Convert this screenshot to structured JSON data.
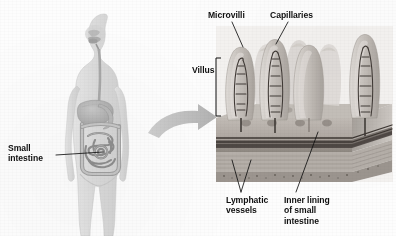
{
  "figure": {
    "background_color": "#fdfdfd",
    "ink_color": "#101010"
  },
  "labels": {
    "small_intestine": {
      "text": "Small\nintestine",
      "x": 8,
      "y": 143
    },
    "microvilli": {
      "text": "Microvilli",
      "x": 208,
      "y": 10
    },
    "capillaries": {
      "text": "Capillaries",
      "x": 270,
      "y": 10
    },
    "villus": {
      "text": "Villus",
      "x": 194,
      "y": 66
    },
    "lymphatic_vessels": {
      "text": "Lymphatic\nvessels",
      "x": 227,
      "y": 196
    },
    "inner_lining": {
      "text": "Inner lining\nof small\nintestine",
      "x": 285,
      "y": 196
    }
  },
  "leader_lines": {
    "small_intestine": "from label right edge to coiled small intestine in abdomen",
    "microvilli": "diagonal down-right to villus surface",
    "capillaries": "diagonal down-left to capillary network inside villus",
    "lymphatic_vessels": "two diagonals up-right to lacteal vessels under villi",
    "inner_lining": "diagonal up-right to mucosa surface layer"
  },
  "villus_bracket": {
    "x": 216,
    "top": 58,
    "bottom": 116
  },
  "magnify_arrow": {
    "from": "abdomen of body figure",
    "to": "villi detail panel",
    "color": "#b9b9b9"
  },
  "detail_panel": {
    "x": 216,
    "y": 28,
    "width": 176,
    "height": 152,
    "villi_count": 7,
    "tissue_layers": [
      "mucosa",
      "submucosa",
      "muscle layer",
      "serosa"
    ]
  },
  "body_figure": {
    "organs": [
      "nasal cavity",
      "oral cavity",
      "esophagus",
      "liver",
      "stomach",
      "large intestine",
      "small intestine"
    ],
    "tint": "#d8d8d8"
  },
  "colors": {
    "body_fill": "#dcdcdc",
    "organ_fill": "#c4c4c4",
    "organ_dark": "#8d8d8d",
    "tissue_mid": "#b2aca6",
    "tissue_dark": "#4a4440",
    "villus_fill": "#cdc8c3",
    "capillary": "#403a36",
    "arrow": "#bcbcbc"
  }
}
